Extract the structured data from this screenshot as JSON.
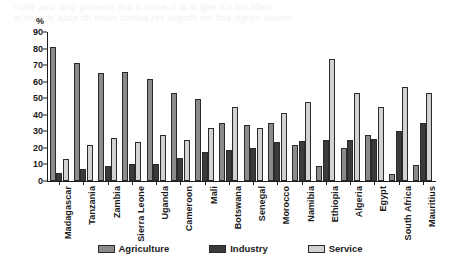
{
  "artifacts": {
    "ghost_line_1": "cipiie apic  ianp gioriemn doe  lt ontoa ci ia   ia lgpe  ica  ast ildare",
    "ghost_line_2": "ai imen  fo  aaoe  tfn nftolu cotrioa    rov  aiigndlt   ont  ftoe  rtgnpe aeoenr"
  },
  "chart_data": {
    "type": "bar",
    "title": "",
    "subtitle": "",
    "xlabel": "",
    "ylabel": "%",
    "ylim": [
      0,
      90
    ],
    "ytick_step": 10,
    "yticks": [
      0,
      10,
      20,
      30,
      40,
      50,
      60,
      70,
      80,
      90
    ],
    "grid": false,
    "legend_position": "bottom",
    "categories": [
      "Madagascar",
      "Tanzania",
      "Zambia",
      "Sierra Leone",
      "Uganda",
      "Cameroon",
      "Mali",
      "Botswana",
      "Senegal",
      "Morocco",
      "Namibia",
      "Ethiopia",
      "Algeria",
      "Egypt",
      "South Africa",
      "Mauritius"
    ],
    "series": [
      {
        "name": "Agriculture",
        "color": "#8a8a8a",
        "values": [
          81,
          71,
          65,
          66,
          61.5,
          53,
          49.5,
          35,
          34,
          35,
          22,
          9,
          20,
          27.5,
          4.5,
          9.5
        ]
      },
      {
        "name": "Industry",
        "color": "#3b3b3b",
        "values": [
          5,
          7.5,
          9,
          10.5,
          10.5,
          14,
          17.5,
          19,
          20,
          23.5,
          24,
          25,
          25,
          25.5,
          30.5,
          35
        ]
      },
      {
        "name": "Service",
        "color": "#d2d2d2",
        "values": [
          13.5,
          21.5,
          26,
          23.5,
          27.5,
          25,
          32,
          45,
          32,
          41,
          48,
          74,
          53,
          45,
          57,
          53
        ]
      }
    ]
  },
  "legend": {
    "items": [
      {
        "label": "Agriculture",
        "key": "agriculture"
      },
      {
        "label": "Industry",
        "key": "industry"
      },
      {
        "label": "Service",
        "key": "service"
      }
    ]
  }
}
